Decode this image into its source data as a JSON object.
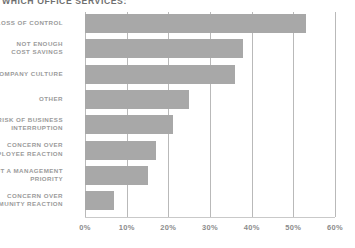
{
  "chart_data": {
    "type": "bar",
    "orientation": "horizontal",
    "title": "WHICH OFFICE SERVICES:",
    "xlabel": "",
    "ylabel": "",
    "xlim": [
      0,
      60
    ],
    "grid": true,
    "legend": "none",
    "tick_labels": [
      "0%",
      "10%",
      "20%",
      "30%",
      "40%",
      "50%",
      "60%"
    ],
    "tick_values": [
      0,
      10,
      20,
      30,
      40,
      50,
      60
    ],
    "categories": [
      "LOSS OF CONTROL",
      "NOT ENOUGH\nCOST SAVINGS",
      "COMPANY CULTURE",
      "OTHER",
      "RISK OF BUSINESS\nINTERRUPTION",
      "CONCERN OVER\nEMPLOYEE REACTION",
      "NOT A MANAGEMENT\nPRIORITY",
      "CONCERN OVER\nCOMMUNITY REACTION"
    ],
    "values": [
      53,
      38,
      36,
      25,
      21,
      17,
      15,
      7
    ],
    "bar_color": "#a8a8a8",
    "grid_color": "#b9b9b9",
    "text_color": "#8c8c8c"
  }
}
